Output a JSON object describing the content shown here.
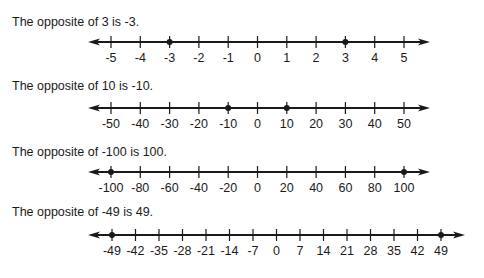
{
  "chart_data": [
    {
      "type": "number_line",
      "caption": "The opposite of 3 is -3.",
      "ticks": [
        -5,
        -4,
        -3,
        -2,
        -1,
        0,
        1,
        2,
        3,
        4,
        5
      ],
      "tick_labels": [
        "-5",
        "-4",
        "-3",
        "-2",
        "-1",
        "0",
        "1",
        "2",
        "3",
        "4",
        "5"
      ],
      "points": [
        -3,
        3
      ],
      "range": [
        -5,
        5
      ],
      "step": 1
    },
    {
      "type": "number_line",
      "caption": "The opposite of 10 is -10.",
      "ticks": [
        -50,
        -40,
        -30,
        -20,
        -10,
        0,
        10,
        20,
        30,
        40,
        50
      ],
      "tick_labels": [
        "-50",
        "-40",
        "-30",
        "-20",
        "-10",
        "0",
        "10",
        "20",
        "30",
        "40",
        "50"
      ],
      "points": [
        -10,
        10
      ],
      "range": [
        -50,
        50
      ],
      "step": 10
    },
    {
      "type": "number_line",
      "caption": "The opposite of -100 is 100.",
      "ticks": [
        -100,
        -80,
        -60,
        -40,
        -20,
        0,
        20,
        40,
        60,
        80,
        100
      ],
      "tick_labels": [
        "-100",
        "-80",
        "-60",
        "-40",
        "-20",
        "0",
        "20",
        "40",
        "60",
        "80",
        "100"
      ],
      "points": [
        -100,
        100
      ],
      "range": [
        -100,
        100
      ],
      "step": 20
    },
    {
      "type": "number_line",
      "caption": "The opposite of -49 is 49.",
      "ticks": [
        -49,
        -42,
        -35,
        -28,
        -21,
        -14,
        -7,
        0,
        7,
        14,
        21,
        28,
        35,
        42,
        49
      ],
      "tick_labels": [
        "-49",
        "-42",
        "-35",
        "-28",
        "-21",
        "-14",
        "-7",
        "0",
        "7",
        "14",
        "21",
        "28",
        "35",
        "42",
        "49"
      ],
      "points": [
        -49,
        49
      ],
      "range": [
        -49,
        49
      ],
      "step": 7
    }
  ],
  "layout": {
    "lines": [
      {
        "caption_top": 15,
        "line_y": 42,
        "x_start": 88,
        "x_end": 430,
        "first_tick_x": 111,
        "last_tick_x": 404
      },
      {
        "caption_top": 79,
        "line_y": 108,
        "x_start": 88,
        "x_end": 430,
        "first_tick_x": 111,
        "last_tick_x": 404
      },
      {
        "caption_top": 145,
        "line_y": 172,
        "x_start": 88,
        "x_end": 430,
        "first_tick_x": 111,
        "last_tick_x": 404
      },
      {
        "caption_top": 205,
        "line_y": 235,
        "x_start": 88,
        "x_end": 465,
        "first_tick_x": 112,
        "last_tick_x": 441
      }
    ],
    "ink": "#1a1a1a"
  }
}
